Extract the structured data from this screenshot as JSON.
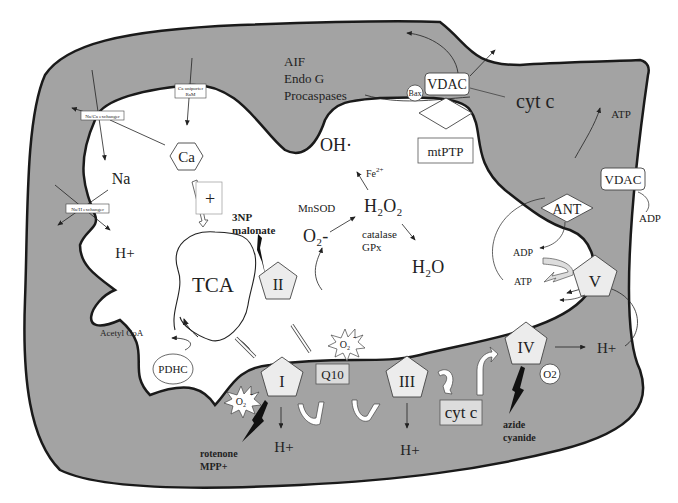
{
  "diagram": {
    "colors": {
      "intermembrane_space": "#a3a3a3",
      "matrix": "#ffffff",
      "complex_fill": "#ececec",
      "membrane_stroke": "#1a1a1a",
      "inhibitor": "#111111"
    },
    "outer_membrane": {
      "transporters": {
        "na_ca_exchanger": "Na/Ca exchanger",
        "ca_uniporter_line1": "Ca uniporter",
        "ca_uniporter_line2": "RaM",
        "na_h_exchanger": "Na/H exchanger"
      },
      "apoptotic_factors": [
        "AIF",
        "Endo G",
        "Procaspases"
      ],
      "vdac_top": "VDAC",
      "bax": "Bax",
      "cyt_c_release": "cyt c",
      "mtptp": "mtPTP",
      "vdac_right": "VDAC",
      "atp_out": "ATP",
      "adp_in": "ADP"
    },
    "matrix": {
      "ca": "Ca",
      "plus": "+",
      "na": "Na",
      "h_plus_left": "H+",
      "tca": "TCA",
      "inhibitor_3np_line1": "3NP",
      "inhibitor_3np_line2": "malonate",
      "oh_radical": "OH·",
      "fe2": "Fe",
      "fe2_sup": "2+",
      "mnsod": "MnSOD",
      "h2o2": "H₂O₂",
      "o2_minus": "O₂-",
      "catalase": "catalase",
      "gpx": "GPx",
      "h2o": "H₂O",
      "acetyl_coa": "Acetyl CoA",
      "pdhc": "PDHC",
      "ant": "ANT",
      "adp_matrix": "ADP",
      "atp_matrix": "ATP"
    },
    "etc": {
      "complex_I": "I",
      "complex_II": "II",
      "complex_III": "III",
      "complex_IV": "IV",
      "complex_V": "V",
      "q10": "Q10",
      "cyt_c": "cyt c",
      "o2": "O2",
      "superoxide": "O₂",
      "superoxide_charge": "-",
      "h_plus_I": "H+",
      "h_plus_III": "H+",
      "h_plus_IV": "H+",
      "inhibitor_I_line1": "rotenone",
      "inhibitor_I_line2": "MPP+",
      "inhibitor_IV_line1": "azide",
      "inhibitor_IV_line2": "cyanide"
    }
  }
}
